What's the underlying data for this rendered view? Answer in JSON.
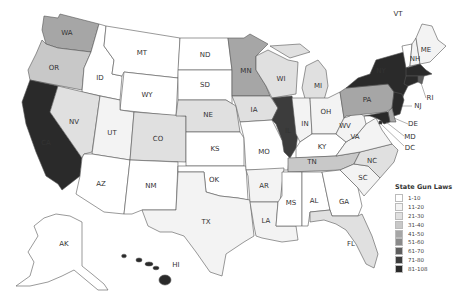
{
  "legend": {
    "title": "State Gun Laws",
    "bins": [
      {
        "label": "1-10",
        "color": "#ffffff"
      },
      {
        "label": "11-20",
        "color": "#f3f3f3"
      },
      {
        "label": "21-30",
        "color": "#e0e0e0"
      },
      {
        "label": "31-40",
        "color": "#c8c8c8"
      },
      {
        "label": "41-50",
        "color": "#a6a6a6"
      },
      {
        "label": "51-60",
        "color": "#8a8a8a"
      },
      {
        "label": "61-70",
        "color": "#5e5e5e"
      },
      {
        "label": "71-80",
        "color": "#3c3c3c"
      },
      {
        "label": "81-108",
        "color": "#2a2a2a"
      }
    ]
  },
  "states": {
    "WA": {
      "label": "WA",
      "bin": 4
    },
    "OR": {
      "label": "OR",
      "bin": 3
    },
    "CA": {
      "label": "CA",
      "bin": 8
    },
    "ID": {
      "label": "ID",
      "bin": 0
    },
    "NV": {
      "label": "NV",
      "bin": 2
    },
    "MT": {
      "label": "MT",
      "bin": 0
    },
    "WY": {
      "label": "WY",
      "bin": 0
    },
    "UT": {
      "label": "UT",
      "bin": 1
    },
    "AZ": {
      "label": "AZ",
      "bin": 0
    },
    "CO": {
      "label": "CO",
      "bin": 2
    },
    "NM": {
      "label": "NM",
      "bin": 0
    },
    "ND": {
      "label": "ND",
      "bin": 0
    },
    "SD": {
      "label": "SD",
      "bin": 0
    },
    "NE": {
      "label": "NE",
      "bin": 2
    },
    "KS": {
      "label": "KS",
      "bin": 0
    },
    "OK": {
      "label": "OK",
      "bin": 0
    },
    "TX": {
      "label": "TX",
      "bin": 1
    },
    "MN": {
      "label": "MN",
      "bin": 4
    },
    "IA": {
      "label": "IA",
      "bin": 2
    },
    "MO": {
      "label": "MO",
      "bin": 0
    },
    "AR": {
      "label": "AR",
      "bin": 1
    },
    "LA": {
      "label": "LA",
      "bin": 1
    },
    "WI": {
      "label": "WI",
      "bin": 2
    },
    "IL": {
      "label": "IL",
      "bin": 7
    },
    "MI": {
      "label": "MI",
      "bin": 2
    },
    "IN": {
      "label": "IN",
      "bin": 1
    },
    "OH": {
      "label": "OH",
      "bin": 1
    },
    "KY": {
      "label": "KY",
      "bin": 0
    },
    "TN": {
      "label": "TN",
      "bin": 3
    },
    "MS": {
      "label": "MS",
      "bin": 0
    },
    "AL": {
      "label": "AL",
      "bin": 0
    },
    "GA": {
      "label": "GA",
      "bin": 0
    },
    "FL": {
      "label": "FL",
      "bin": 2
    },
    "SC": {
      "label": "SC",
      "bin": 1
    },
    "NC": {
      "label": "NC",
      "bin": 2
    },
    "VA": {
      "label": "VA",
      "bin": 1
    },
    "WV": {
      "label": "WV",
      "bin": 1
    },
    "PA": {
      "label": "PA",
      "bin": 4
    },
    "NY": {
      "label": "NY",
      "bin": 8
    },
    "VT": {
      "label": "VT",
      "bin": 0
    },
    "NH": {
      "label": "NH",
      "bin": 1
    },
    "ME": {
      "label": "ME",
      "bin": 1
    },
    "MA": {
      "label": "",
      "bin": 8
    },
    "RI": {
      "label": "RI",
      "bin": 6
    },
    "CT": {
      "label": "",
      "bin": 8
    },
    "NJ": {
      "label": "NJ",
      "bin": 8
    },
    "DE": {
      "label": "DE",
      "bin": 4
    },
    "MD": {
      "label": "MD",
      "bin": 8
    },
    "DC": {
      "label": "DC",
      "bin": 8
    },
    "AK": {
      "label": "AK",
      "bin": 0
    },
    "HI": {
      "label": "HI",
      "bin": 8
    }
  }
}
